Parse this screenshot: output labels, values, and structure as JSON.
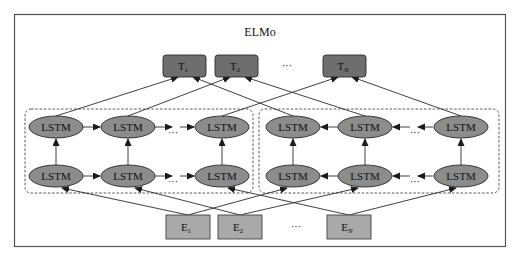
{
  "title": "ELMo",
  "colors": {
    "background": "#ffffff",
    "frame": "#555555",
    "token_box_fill": "#6e6e6e",
    "embedding_box_fill": "#a9a9a9",
    "lstm_fill": "#8c8c8c",
    "stroke": "#2a2a2a",
    "dashed": "#444444"
  },
  "outputs": [
    {
      "id": "T1",
      "base": "T",
      "sub": "1"
    },
    {
      "id": "T2",
      "base": "T",
      "sub": "2"
    },
    {
      "id": "TN",
      "base": "T",
      "sub": "N"
    }
  ],
  "outputs_ellipsis": "···",
  "inputs": [
    {
      "id": "E1",
      "base": "E",
      "sub": "1"
    },
    {
      "id": "E2",
      "base": "E",
      "sub": "2"
    },
    {
      "id": "EN",
      "base": "E",
      "sub": "N"
    }
  ],
  "inputs_ellipsis": "···",
  "forward_lstm": {
    "direction": "left-to-right",
    "layers": [
      {
        "layer": 2,
        "cells": [
          "LSTM",
          "LSTM",
          "LSTM"
        ]
      },
      {
        "layer": 1,
        "cells": [
          "LSTM",
          "LSTM",
          "LSTM"
        ]
      }
    ],
    "ellipsis": "···"
  },
  "backward_lstm": {
    "direction": "right-to-left",
    "layers": [
      {
        "layer": 2,
        "cells": [
          "LSTM",
          "LSTM",
          "LSTM"
        ]
      },
      {
        "layer": 1,
        "cells": [
          "LSTM",
          "LSTM",
          "LSTM"
        ]
      }
    ],
    "ellipsis": "···"
  }
}
